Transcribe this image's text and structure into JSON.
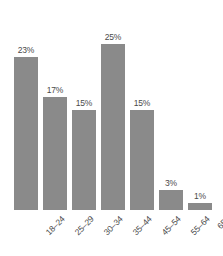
{
  "chart_data": {
    "type": "bar",
    "title": "",
    "subtitle": "",
    "xlabel": "",
    "ylabel": "",
    "categories": [
      "18–24",
      "25–29",
      "30–34",
      "35–44",
      "45–54",
      "55–64",
      "65+"
    ],
    "values": [
      23,
      17,
      15,
      25,
      15,
      3,
      1
    ],
    "value_labels": [
      "23%",
      "17%",
      "15%",
      "25%",
      "15%",
      "3%",
      "1%"
    ],
    "ylim": [
      0,
      25
    ],
    "grid": false,
    "legend": null,
    "legend_position": "none",
    "axis_lines": false,
    "tick_labels_y": [],
    "annotations": [],
    "bar_color": "#8a8a8a",
    "label_color": "#4a4a4a",
    "background_color": "#ffffff",
    "category_label_rotation": -45
  }
}
